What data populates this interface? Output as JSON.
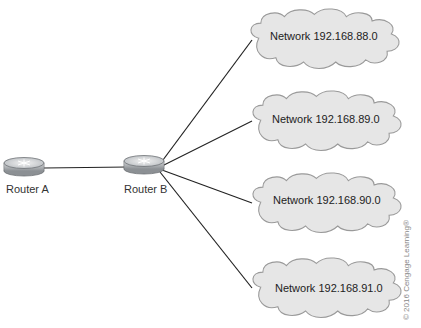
{
  "routers": [
    {
      "id": "router-a",
      "label": "Router A"
    },
    {
      "id": "router-b",
      "label": "Router B"
    }
  ],
  "networks": [
    {
      "label": "Network 192.168.88.0"
    },
    {
      "label": "Network 192.168.89.0"
    },
    {
      "label": "Network 192.168.90.0"
    },
    {
      "label": "Network 192.168.91.0"
    }
  ],
  "copyright": "© 2016 Cengage Learning®",
  "colors": {
    "cloud_fill": "#e6e6e6",
    "cloud_stroke": "#9a9a9a",
    "line": "#222222",
    "router_body": "#a8acb0"
  }
}
